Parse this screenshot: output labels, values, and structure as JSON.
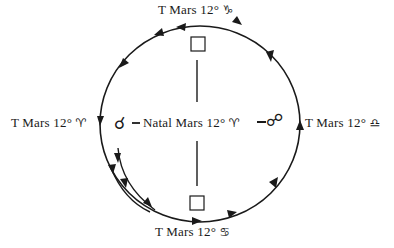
{
  "diagram": {
    "colors": {
      "ink": "#1a1a1a",
      "background": "#ffffff"
    },
    "labels": {
      "top": {
        "prefix": "T Mars 12°",
        "sign": "♑",
        "sign_name": "Capricorn"
      },
      "left": {
        "prefix": "T Mars 12°",
        "sign": "♈",
        "sign_name": "Aries"
      },
      "right": {
        "prefix": "T Mars 12°",
        "sign": "♎",
        "sign_name": "Libra"
      },
      "bottom": {
        "prefix": "T Mars 12°",
        "sign": "♋",
        "sign_name": "Cancer"
      },
      "center": {
        "prefix": "Natal Mars 12°",
        "sign": "♈",
        "sign_name": "Aries"
      }
    },
    "aspects": {
      "conjunction": {
        "symbol": "☌",
        "name": "conjunction"
      },
      "opposition": {
        "symbol": "☍",
        "name": "opposition"
      },
      "square_top": {
        "symbol": "□",
        "name": "square"
      },
      "square_bottom": {
        "symbol": "□",
        "name": "square"
      }
    },
    "cycle_direction": "counterclockwise"
  }
}
